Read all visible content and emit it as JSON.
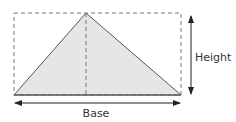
{
  "diagram": {
    "labels": {
      "height": "Height",
      "base": "Base"
    },
    "colors": {
      "fill": "#e6e6e6",
      "stroke": "#555555",
      "dashed": "#777777",
      "arrow": "#222222"
    },
    "shapes": {
      "rectangle": {
        "x": 14,
        "y": 13,
        "width": 167,
        "height": 82,
        "style": "dashed"
      },
      "triangle": {
        "points": [
          [
            14,
            95
          ],
          [
            86,
            13
          ],
          [
            181,
            95
          ]
        ]
      },
      "altitude": {
        "x": 86,
        "y1": 13,
        "y2": 95,
        "style": "dashed"
      },
      "height_arrow": {
        "x": 191,
        "y1": 15,
        "y2": 95
      },
      "base_arrow": {
        "y": 103,
        "x1": 14,
        "x2": 181
      }
    }
  }
}
